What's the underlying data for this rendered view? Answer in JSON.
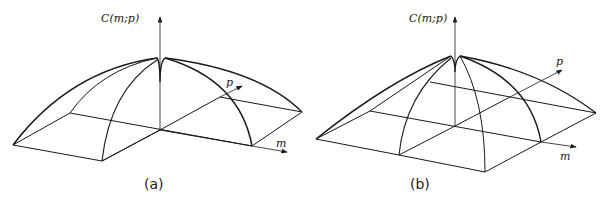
{
  "panels": [
    {
      "id": "a",
      "caption": "(a)",
      "z_axis_label": "C(m;p)",
      "x_axis_label": "m",
      "y_axis_label": "p"
    },
    {
      "id": "b",
      "caption": "(b)",
      "z_axis_label": "C(m;p)",
      "x_axis_label": "m",
      "y_axis_label": "p"
    }
  ],
  "colors": {
    "stroke": "#1a1a1a",
    "background": "#ffffff"
  }
}
